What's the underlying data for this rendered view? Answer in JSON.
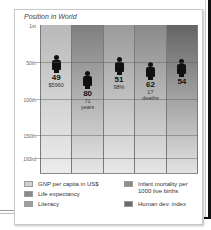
{
  "chart_data": {
    "type": "bar",
    "title": "Position in World",
    "ylabel": "World rank",
    "yticks": [
      "1st",
      "50th",
      "100th",
      "150th",
      "193rd"
    ],
    "ylim": [
      1,
      193
    ],
    "y_inverted": true,
    "categories": [
      "GNP per capita in US$",
      "Life expectancy",
      "Literacy",
      "Infant mortality per 1000 live births",
      "Human dev. index"
    ],
    "values": [
      49,
      80,
      51,
      62,
      54
    ],
    "value_labels": [
      "$5960",
      "71 years",
      "98%",
      "17 deaths",
      ""
    ],
    "colors": [
      "#cfcfcf",
      "#8c8c8c",
      "#a6a6a6",
      "#979797",
      "#6f6f6f"
    ],
    "grid": true,
    "legend_position": "bottom"
  },
  "title": "Position in World",
  "axis": {
    "ticks": [
      {
        "label": "1st",
        "top": 25
      },
      {
        "label": "50th",
        "top": 62
      },
      {
        "label": "100th",
        "top": 99
      },
      {
        "label": "150th",
        "top": 135
      },
      {
        "label": "193rd",
        "top": 158
      }
    ]
  },
  "columns": [
    {
      "rank": "49",
      "line1": "$5960",
      "line2": "",
      "gradTop": "#b9b9b9",
      "gradBottom": "#ececec",
      "figTop": 55
    },
    {
      "rank": "80",
      "line1": "71",
      "line2": "years",
      "gradTop": "#7e7e7e",
      "gradBottom": "#e6e6e6",
      "figTop": 71
    },
    {
      "rank": "51",
      "line1": "98%",
      "line2": "",
      "gradTop": "#9a9a9a",
      "gradBottom": "#e8e8e8",
      "figTop": 57
    },
    {
      "rank": "62",
      "line1": "17",
      "line2": "deaths",
      "gradTop": "#8a8a8a",
      "gradBottom": "#e6e6e6",
      "figTop": 62
    },
    {
      "rank": "54",
      "line1": "",
      "line2": "",
      "gradTop": "#646464",
      "gradBottom": "#e2e2e2",
      "figTop": 59
    }
  ],
  "legend": [
    {
      "label": "GNP per capita in US$",
      "color": "#d2d2d2"
    },
    {
      "label": "Life expectancy",
      "color": "#8a8a8a"
    },
    {
      "label": "Literacy",
      "color": "#a0a0a0"
    },
    {
      "label": "Infant mortality per 1000 live births",
      "line1": "Infant mortality per",
      "line2": "1000 live births",
      "color": "#8e8e8e"
    },
    {
      "label": "Human dev. index",
      "color": "#6a6a6a"
    }
  ]
}
